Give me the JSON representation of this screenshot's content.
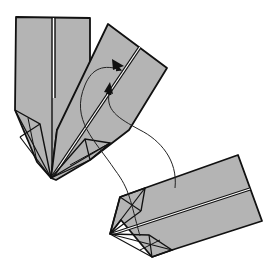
{
  "diagram": {
    "type": "origami-folding-step",
    "colors": {
      "paper": "#b4b4b4",
      "outline": "#111111",
      "crease": "#ffffff",
      "background": "#ffffff"
    },
    "parts": [
      {
        "id": "unit-vertical",
        "label": "Vertical folded unit"
      },
      {
        "id": "unit-tilted",
        "label": "Tilted folded unit with pocket"
      },
      {
        "id": "unit-inserting",
        "label": "Loose unit to insert"
      }
    ],
    "arrows": [
      {
        "id": "insert-arrow-1",
        "label": "Insert tip into pocket (upper)"
      },
      {
        "id": "insert-arrow-2",
        "label": "Insert tip into pocket (lower)"
      }
    ]
  }
}
